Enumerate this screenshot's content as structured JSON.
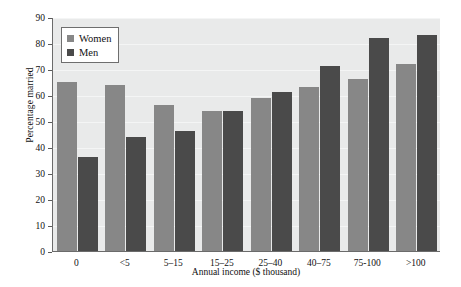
{
  "chart_data": {
    "type": "bar",
    "title": "",
    "xlabel": "Annual income ($ thousand)",
    "ylabel": "Percentage married",
    "categories": [
      "0",
      "<5",
      "5–15",
      "15–25",
      "25–40",
      "40–75",
      "75-100",
      ">100"
    ],
    "series": [
      {
        "name": "Women",
        "color": "#878787",
        "values": [
          65,
          64,
          56,
          54,
          59,
          63,
          66,
          72
        ]
      },
      {
        "name": "Men",
        "color": "#4a4a4a",
        "values": [
          36,
          44,
          46,
          54,
          61,
          71,
          82,
          83
        ]
      }
    ],
    "ylim": [
      0,
      90
    ],
    "y_ticks": [
      0,
      10,
      20,
      30,
      40,
      50,
      60,
      70,
      80,
      90
    ],
    "y_tick_labels": [
      "0",
      "10",
      "20",
      "30",
      "40",
      "50",
      "60",
      "70",
      "80",
      "90"
    ],
    "grid": true,
    "legend_position": "top-left",
    "plot_background": "#e9eaea",
    "gridline_color": "#f4f5f5",
    "axis_color": "#6b6b6b"
  },
  "legend": {
    "entries": [
      {
        "label": "Women",
        "swatch": "women-swatch"
      },
      {
        "label": "Men",
        "swatch": "men-swatch"
      }
    ]
  }
}
